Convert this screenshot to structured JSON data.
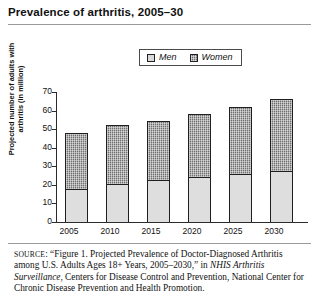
{
  "figure": {
    "title": "Prevalence of arthritis, 2005–30"
  },
  "legend": {
    "position": "top-center",
    "entries": [
      {
        "label": "Men",
        "swatch": "light-gray-square",
        "color": "#dedede"
      },
      {
        "label": "Women",
        "swatch": "dark-crosshatch-square",
        "color": "#6f6f6f"
      }
    ]
  },
  "axes": {
    "ylabel": "Projected number of adults with arthritis (in million)",
    "yticks": [
      "70",
      "60",
      "50",
      "40",
      "30",
      "20",
      "10",
      "0"
    ],
    "xticks": [
      "2005",
      "2010",
      "2015",
      "2020",
      "2025",
      "2030"
    ]
  },
  "source": {
    "label": "SOURCE",
    "text_1": ": “Figure 1. Projected Prevalence of Doctor-Diagnosed Arthritis among U.S. Adults Ages 18+ Years, 2005–2030,” in ",
    "italic_1": "NHIS Arthritis Surveillance",
    "text_2": ", Centers for Disease Control and Prevention, National Center for Chronic Disease Prevention and Health Promotion."
  },
  "chart_data": {
    "type": "bar",
    "subtype": "stacked-bar",
    "title": "Prevalence of arthritis, 2005–30",
    "xlabel": "",
    "ylabel": "Projected number of adults with arthritis (in million)",
    "categories": [
      "2005",
      "2010",
      "2015",
      "2020",
      "2025",
      "2030"
    ],
    "series": [
      {
        "name": "Men",
        "values": [
          18,
          20.5,
          22.5,
          24,
          26,
          27.5
        ]
      },
      {
        "name": "Women",
        "values": [
          30,
          31.5,
          32,
          34,
          36,
          38.5
        ]
      }
    ],
    "totals": [
      48,
      52,
      54.5,
      58,
      62,
      66
    ],
    "ylim": [
      0,
      70
    ],
    "ytick_step": 10,
    "grid": false,
    "legend_position": "top-center",
    "units": "million adults"
  }
}
